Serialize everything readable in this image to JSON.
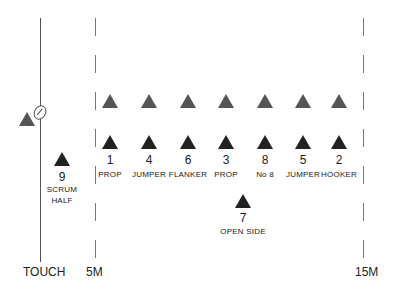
{
  "diagram": {
    "type": "rugby-lineout",
    "lines": {
      "touch": {
        "label": "TOUCH"
      },
      "five_m": {
        "label": "5M"
      },
      "fifteen_m": {
        "label": "15M"
      }
    },
    "thrower": {
      "color": "#555555"
    },
    "colors": {
      "attack": "#222222",
      "defence": "#555555",
      "line": "#777777"
    },
    "scrum_half": {
      "number": "9",
      "label_line1": "SCRUM",
      "label_line2": "HALF"
    },
    "lineout": [
      {
        "number": "1",
        "position": "PROP"
      },
      {
        "number": "4",
        "position": "JUMPER"
      },
      {
        "number": "6",
        "position": "FLANKER"
      },
      {
        "number": "3",
        "position": "PROP"
      },
      {
        "number": "8",
        "position": "No 8"
      },
      {
        "number": "5",
        "position": "JUMPER"
      },
      {
        "number": "2",
        "position": "HOOKER"
      }
    ],
    "open_side": {
      "number": "7",
      "position": "OPEN SIDE"
    },
    "opposition_count": 7
  }
}
